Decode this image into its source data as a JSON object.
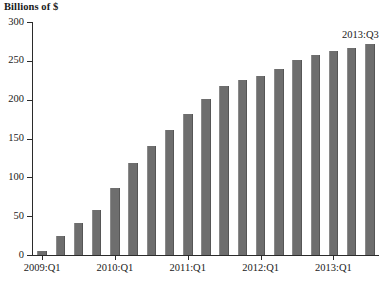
{
  "chart_data": {
    "type": "bar",
    "title": "",
    "ylabel": "Billions of $",
    "xlabel": "",
    "ylim": [
      0,
      300
    ],
    "ytick_values": [
      0,
      50,
      100,
      150,
      200,
      250,
      300
    ],
    "ytick_labels": [
      "0",
      "50",
      "100",
      "150",
      "200",
      "250",
      "300"
    ],
    "grid": false,
    "legend": null,
    "bar_color": "#6e6e6e",
    "axis_color": "#2b2b2b",
    "categories": [
      "2009:Q1",
      "2009:Q2",
      "2009:Q3",
      "2009:Q4",
      "2010:Q1",
      "2010:Q2",
      "2010:Q3",
      "2010:Q4",
      "2011:Q1",
      "2011:Q2",
      "2011:Q3",
      "2011:Q4",
      "2012:Q1",
      "2012:Q2",
      "2012:Q3",
      "2012:Q4",
      "2013:Q1",
      "2013:Q2",
      "2013:Q3"
    ],
    "values": [
      5,
      24,
      41,
      58,
      86,
      119,
      141,
      161,
      181,
      201,
      217,
      225,
      231,
      240,
      251,
      258,
      263,
      267,
      272
    ],
    "xtick_labels": [
      "2009:Q1",
      "2010:Q1",
      "2011:Q1",
      "2012:Q1",
      "2013:Q1"
    ],
    "xtick_category_indices": [
      0,
      4,
      8,
      12,
      16
    ],
    "annotations": [
      {
        "text": "2013:Q3",
        "category": "2013:Q3",
        "value": 272
      }
    ]
  },
  "footnote": {
    "text": ""
  }
}
